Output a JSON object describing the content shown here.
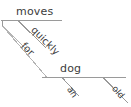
{
  "diagram": {
    "type": "reed-kellogg-sentence-diagram",
    "background_color": "#ffffff",
    "line_color": "#9a9a9a",
    "text_color": "#3c3c3c",
    "words": {
      "verb": "moves",
      "adverb": "quickly",
      "preposition": "for",
      "object_of_preposition": "dog",
      "article": "an",
      "adjective": "old"
    },
    "labels": {
      "moves": "moves",
      "quickly": "quickly",
      "for": "for",
      "dog": "dog",
      "an": "an",
      "old": "old"
    }
  }
}
